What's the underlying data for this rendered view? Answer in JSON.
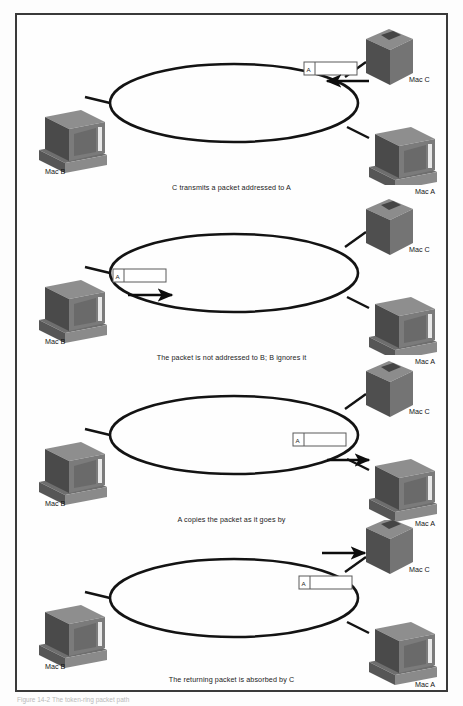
{
  "figure": {
    "type": "network-diagram",
    "topology": "token-ring",
    "border_color": "#3a3a3a",
    "background_color": "#fefefe",
    "bottom_caption": "Figure 14-2  The token-ring packet path",
    "packet_label": "A",
    "ink_color": "#141414"
  },
  "nodes": {
    "mac_a": "Mac A",
    "mac_b": "Mac B",
    "mac_c": "Mac C"
  },
  "panels": [
    {
      "index": 1,
      "caption": "C transmits a packet addressed to A",
      "packet_label": "A",
      "packet_position": "top-right-outside-ring",
      "arrow_direction": "left",
      "arrow_from": "Mac C",
      "arrow_to": "ring"
    },
    {
      "index": 2,
      "caption": "The packet is not addressed to B; B ignores it",
      "packet_label": "A",
      "packet_position": "left-inside-ring",
      "arrow_direction": "right",
      "arrow_from": "Mac B",
      "arrow_to": "ring"
    },
    {
      "index": 3,
      "caption": "A copies the packet as it goes by",
      "packet_label": "A",
      "packet_position": "right-inside-ring",
      "arrow_direction": "right",
      "arrow_from": "ring",
      "arrow_to": "Mac A"
    },
    {
      "index": 4,
      "caption": "The returning packet is absorbed by C",
      "packet_label": "A",
      "packet_position": "right-inside-ring",
      "arrow_direction": "right",
      "arrow_from": "ring",
      "arrow_to": "Mac C"
    }
  ]
}
